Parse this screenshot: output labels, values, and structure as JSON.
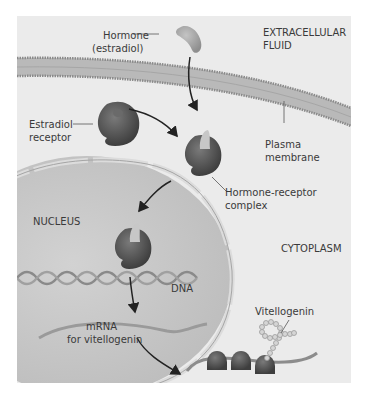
{
  "diagram": {
    "regions": {
      "extracellular": "EXTRACELLULAR",
      "extracellular2": "FLUID",
      "nucleus": "NUCLEUS",
      "cytoplasm": "CYTOPLASM"
    },
    "labels": {
      "hormone_line1": "Hormone",
      "hormone_line2": "(estradiol)",
      "receptor_line1": "Estradiol",
      "receptor_line2": "receptor",
      "membrane_line1": "Plasma",
      "membrane_line2": "membrane",
      "complex_line1": "Hormone-receptor",
      "complex_line2": "complex",
      "dna": "DNA",
      "mrna_line1": "mRNA",
      "mrna_line2": "for vitellogenin",
      "vitellogenin": "Vitellogenin"
    },
    "colors": {
      "background": "#ebebeb",
      "nucleus": "#c9c9c9",
      "membrane": "#b0b0b0",
      "receptor": "#555555",
      "hormone": "#a8a8a8",
      "arrow": "#222222"
    }
  }
}
